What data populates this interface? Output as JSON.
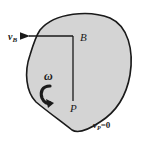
{
  "diagram": {
    "labels": {
      "point_b": "B",
      "point_p": "P",
      "velocity_b": "v",
      "velocity_b_sub": "B",
      "omega": "ω",
      "velocity_p": "v",
      "velocity_p_sub": "P",
      "velocity_p_value": "=0"
    },
    "colors": {
      "body_fill": "#d4d4d4",
      "outline": "#1a1a1a",
      "background": "#ffffff"
    }
  }
}
